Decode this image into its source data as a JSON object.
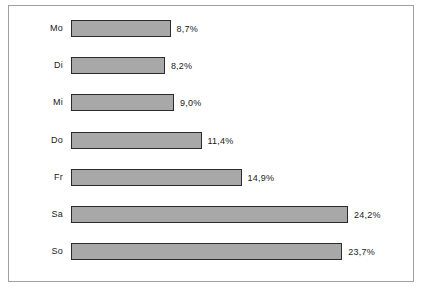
{
  "chart_data": {
    "type": "bar",
    "orientation": "horizontal",
    "title": "",
    "subtitle": "",
    "xlabel": "",
    "ylabel": "",
    "grid": false,
    "legend": false,
    "legend_position": "none",
    "axis_visible": false,
    "xlim": [
      0,
      26
    ],
    "categories": [
      "Mo",
      "Di",
      "Mi",
      "Do",
      "Fr",
      "Sa",
      "So"
    ],
    "values": [
      8.7,
      8.2,
      9.0,
      11.4,
      14.9,
      24.2,
      23.7
    ],
    "value_labels": [
      "8,7%",
      "8,2%",
      "9,0%",
      "11,4%",
      "14,9%",
      "24,2%",
      "23,7%"
    ],
    "bars": [
      {
        "category": "Mo",
        "value": 8.7,
        "label": "8,7%"
      },
      {
        "category": "Di",
        "value": 8.2,
        "label": "8,2%"
      },
      {
        "category": "Mi",
        "value": 9.0,
        "label": "9,0%"
      },
      {
        "category": "Do",
        "value": 11.4,
        "label": "11,4%"
      },
      {
        "category": "Fr",
        "value": 14.9,
        "label": "14,9%"
      },
      {
        "category": "Sa",
        "value": 24.2,
        "label": "24,2%"
      },
      {
        "category": "So",
        "value": 23.7,
        "label": "23,7%"
      }
    ],
    "colors": {
      "bar_fill": "#a8a8a8",
      "bar_border": "#2b2b2b",
      "frame_border": "#a0a0a0",
      "background": "#ffffff",
      "text": "#1a1a1a"
    }
  }
}
